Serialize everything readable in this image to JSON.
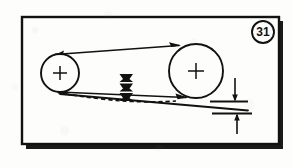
{
  "figure": {
    "number_label": "31",
    "background_color": "#fdfdfb",
    "ink_color": "#111111",
    "border": {
      "name": "figure-border",
      "style": "solid rectangle with heavy bottom and right drop shadow",
      "x": 22,
      "y": 17,
      "width": 257,
      "height": 127
    },
    "badge": {
      "name": "figure-number-badge",
      "shape": "circle",
      "cx": 263,
      "cy": 32,
      "r": 11,
      "text": "31"
    },
    "pulleys": [
      {
        "name": "left-pulley",
        "label": "small pulley",
        "cx": 60,
        "cy": 73,
        "r": 19,
        "center_mark": "crosshair"
      },
      {
        "name": "right-pulley",
        "label": "large pulley",
        "cx": 196,
        "cy": 71,
        "r": 27,
        "center_mark": "crosshair"
      }
    ],
    "belt": {
      "name": "drive-belt",
      "top_span": "tangent line from small pulley top to large pulley top, arrowhead pointing right",
      "bottom_span": "tangent line from small pulley bottom to large pulley bottom, arrowhead pointing right",
      "deflected_span": "dashed line bowing downward at mid-span"
    },
    "deflection_marker": {
      "name": "deflection-force-arrows",
      "description": "stacked solid arrowheads pressing down on belt mid-span",
      "count": 3,
      "x": 126,
      "y_top": 74,
      "direction": "down"
    },
    "dimension": {
      "name": "deflection-dimension",
      "description": "vertical dimension line with double arrowheads between two horizontal reference lines",
      "x": 235,
      "y_top": 78,
      "y_bottom": 132,
      "reference_line_upper_y": 102,
      "reference_line_lower_y": 114
    }
  }
}
